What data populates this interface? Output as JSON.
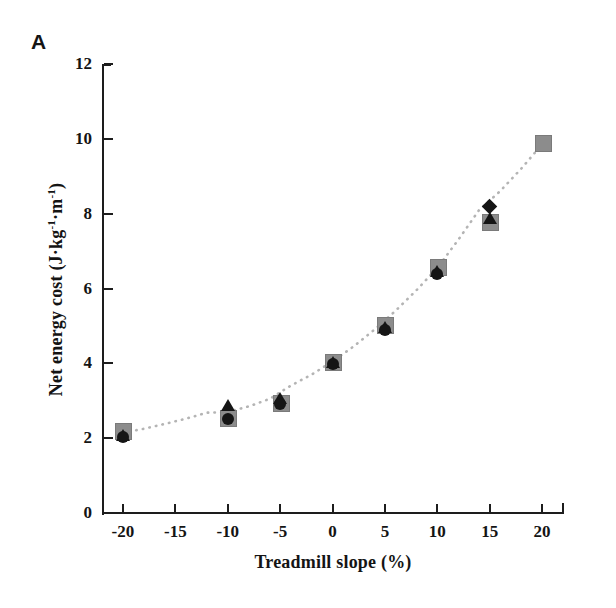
{
  "figure": {
    "panel_label": "A",
    "background_color": "#ffffff",
    "axis_color": "#1d1d1d"
  },
  "chart_data": {
    "type": "scatter",
    "title": "A",
    "xlabel": "Treadmill slope (%)",
    "ylabel": "Net energy cost (J·kg⁻¹·m⁻¹)",
    "ylabel_parts": {
      "prefix": "Net energy cost (J·kg",
      "sup1": "-1",
      "middle": "·m",
      "sup2": "-1",
      "suffix": ")"
    },
    "x": [
      -20,
      -15,
      -10,
      -5,
      0,
      5,
      10,
      15,
      20
    ],
    "xlim": [
      -22,
      22
    ],
    "ylim": [
      0,
      12
    ],
    "xticks": [
      -20,
      -15,
      -10,
      -5,
      0,
      5,
      10,
      15,
      20
    ],
    "xtick_labels": [
      "-20",
      "-15",
      "-10",
      "-5",
      "0",
      "5",
      "10",
      "15",
      "20"
    ],
    "yticks": [
      0,
      2,
      4,
      6,
      8,
      10,
      12
    ],
    "ytick_labels": [
      "0",
      "2",
      "4",
      "6",
      "8",
      "10",
      "12"
    ],
    "grid": false,
    "legend": null,
    "series": [
      {
        "name": "gray-square-series",
        "marker": "square",
        "color": "#8c8c8c",
        "x": [
          -20,
          -10,
          -5,
          0,
          5,
          10,
          15,
          20
        ],
        "values": [
          2.2,
          2.55,
          2.95,
          4.05,
          5.05,
          6.6,
          7.8,
          9.9
        ]
      },
      {
        "name": "black-triangle-series",
        "marker": "triangle",
        "color": "#151515",
        "x": [
          -20,
          -10,
          -5,
          0,
          5,
          10,
          15
        ],
        "values": [
          2.05,
          2.85,
          3.05,
          4.0,
          4.95,
          6.45,
          7.85
        ]
      },
      {
        "name": "black-circle-series",
        "marker": "circle",
        "color": "#151515",
        "x": [
          -20,
          -10,
          -5,
          0,
          5,
          10
        ],
        "values": [
          2.02,
          2.5,
          2.9,
          3.98,
          4.9,
          6.4
        ]
      },
      {
        "name": "black-diamond-series",
        "marker": "diamond",
        "color": "#151515",
        "x": [
          15
        ],
        "values": [
          8.2
        ]
      }
    ],
    "trendline": {
      "name": "fitted-curve",
      "style": "dotted",
      "color": "#b4b4b4",
      "points": [
        [
          -20,
          2.15
        ],
        [
          -18,
          2.25
        ],
        [
          -16,
          2.38
        ],
        [
          -14,
          2.52
        ],
        [
          -12,
          2.68
        ],
        [
          -10,
          2.7
        ],
        [
          -8,
          2.85
        ],
        [
          -6,
          3.05
        ],
        [
          -4,
          3.4
        ],
        [
          -2,
          3.7
        ],
        [
          0,
          4.05
        ],
        [
          2,
          4.45
        ],
        [
          4,
          4.9
        ],
        [
          6,
          5.4
        ],
        [
          8,
          5.95
        ],
        [
          10,
          6.55
        ],
        [
          12,
          7.3
        ],
        [
          14,
          8.1
        ],
        [
          16,
          8.6
        ],
        [
          18,
          9.2
        ],
        [
          20,
          9.85
        ]
      ]
    }
  }
}
